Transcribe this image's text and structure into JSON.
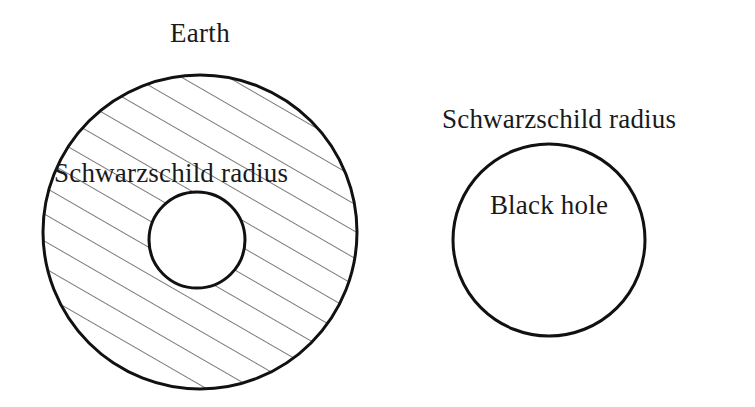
{
  "figure": {
    "domain": "diagram",
    "width": 755,
    "height": 407,
    "background_color": "#ffffff",
    "stroke_color": "#111111",
    "text_color": "#1a1a1a"
  },
  "labels": {
    "earth": "Earth",
    "earth_schwarzschild_radius": "Schwarzschild radius",
    "black_hole_schwarzschild_radius": "Schwarzschild radius",
    "black_hole": "Black hole"
  },
  "shapes": {
    "earth_disc": {
      "name": "Earth",
      "cx": 200,
      "cy": 232,
      "r": 157,
      "stroke_width": 3,
      "fill": "none",
      "hatched": true
    },
    "earth_schwarzschild_circle": {
      "name": "Schwarzschild radius of Earth",
      "cx": 197,
      "cy": 240,
      "r": 48,
      "stroke_width": 3,
      "fill": "#ffffff",
      "hatched": false
    },
    "black_hole_circle": {
      "name": "Black hole",
      "cx": 549,
      "cy": 240,
      "r": 96,
      "stroke_width": 3,
      "fill": "none",
      "hatched": false
    }
  },
  "hatching": {
    "angle_deg": 60,
    "spacing_px": 27,
    "line_width": 1.2,
    "color": "#222222"
  }
}
